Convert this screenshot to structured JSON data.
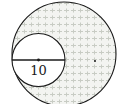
{
  "diagram": {
    "type": "geometry",
    "small_circle": {
      "cx": 38.5,
      "cy": 60,
      "r": 26.5,
      "diameter_label": "10"
    },
    "large_circle": {
      "cx": 64,
      "cy": 54,
      "r": 52
    },
    "shade_color": "#d9dcd6",
    "stroke_color": "#1a1a1a"
  }
}
